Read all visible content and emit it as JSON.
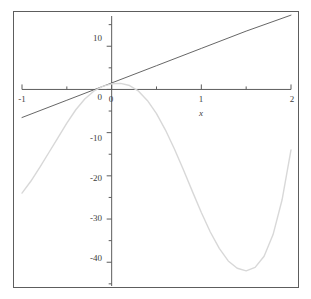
{
  "chart_data": {
    "type": "line",
    "title": "",
    "subtitle": "",
    "xlabel": "x",
    "ylabel": "",
    "xlim": [
      -1,
      2
    ],
    "ylim": [
      -45.5,
      17
    ],
    "grid": false,
    "legend": "none",
    "x_ticks_major": [
      -1,
      0,
      1,
      2
    ],
    "x_ticks_major_labels": [
      "-1",
      "0",
      "1",
      "2"
    ],
    "x_ticks_minor": [
      -0.5,
      0.5,
      1.5
    ],
    "y_ticks_major": [
      10,
      0,
      -10,
      -20,
      -30,
      -40
    ],
    "y_ticks_major_labels": [
      "10",
      "0",
      "-10",
      "-20",
      "-30",
      "-40"
    ],
    "y_ticks_minor": [
      15,
      5,
      -5,
      -15,
      -25,
      -35,
      -45
    ],
    "axis_color": "#5d5d5d",
    "frame_color": "#5d5d5d",
    "background": "#ffffff",
    "series": [
      {
        "name": "line",
        "type": "line",
        "color": "#555555",
        "width": 0.9,
        "x": [
          -1,
          -0.5,
          0,
          0.5,
          1,
          1.5,
          2
        ],
        "values": [
          -6.5,
          -2.5,
          1.5,
          5.5,
          9.5,
          13.5,
          17.2
        ]
      },
      {
        "name": "curve",
        "type": "line",
        "color": "#d8d8d8",
        "width": 1.4,
        "x": [
          -1,
          -0.9,
          -0.8,
          -0.7,
          -0.6,
          -0.5,
          -0.4,
          -0.3,
          -0.2,
          -0.1,
          0,
          0.1,
          0.2,
          0.3,
          0.4,
          0.5,
          0.6,
          0.7,
          0.8,
          0.9,
          1,
          1.1,
          1.2,
          1.3,
          1.4,
          1.5,
          1.6,
          1.7,
          1.8,
          1.9,
          2
        ],
        "values": [
          -24.0,
          -21.2,
          -18.0,
          -14.6,
          -11.2,
          -7.8,
          -4.7,
          -2.2,
          -0.4,
          0.7,
          1.3,
          1.4,
          0.9,
          -0.4,
          -2.6,
          -5.6,
          -9.4,
          -13.8,
          -18.6,
          -23.6,
          -28.5,
          -33.0,
          -36.8,
          -39.7,
          -41.4,
          -42.0,
          -41.2,
          -38.6,
          -33.6,
          -25.6,
          -14.0
        ]
      }
    ]
  },
  "axis_labels": {
    "x_axis_name": "x"
  },
  "icons": {
    "plot_frame": "plot-frame"
  }
}
